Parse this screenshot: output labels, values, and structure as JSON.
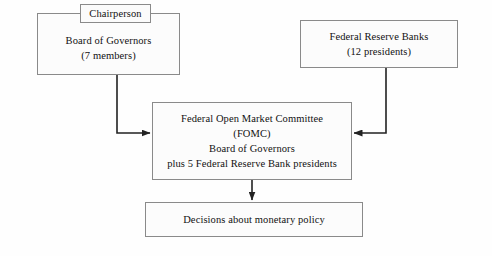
{
  "diagram": {
    "stroke_color": "#222222",
    "box_border_color": "#8a8a8a",
    "background_color": "#fefefe",
    "boxes": {
      "chairperson": {
        "label": "Chairperson"
      },
      "board_of_governors": {
        "line1": "Board of Governors",
        "line2": "(7 members)"
      },
      "federal_reserve_banks": {
        "line1": "Federal Reserve Banks",
        "line2": "(12 presidents)"
      },
      "fomc": {
        "line1": "Federal Open Market Committee",
        "line2": "(FOMC)",
        "line3": "Board of Governors",
        "line4": "plus 5 Federal Reserve Bank presidents"
      },
      "decisions": {
        "label": "Decisions about monetary policy"
      }
    },
    "connectors": [
      {
        "name": "board-to-fomc-arrow",
        "from": "board_of_governors",
        "to": "fomc",
        "direction": "down-then-right"
      },
      {
        "name": "banks-to-fomc-arrow",
        "from": "federal_reserve_banks",
        "to": "fomc",
        "direction": "down-then-left"
      },
      {
        "name": "fomc-to-decisions-arrow",
        "from": "fomc",
        "to": "decisions",
        "direction": "down"
      }
    ]
  }
}
